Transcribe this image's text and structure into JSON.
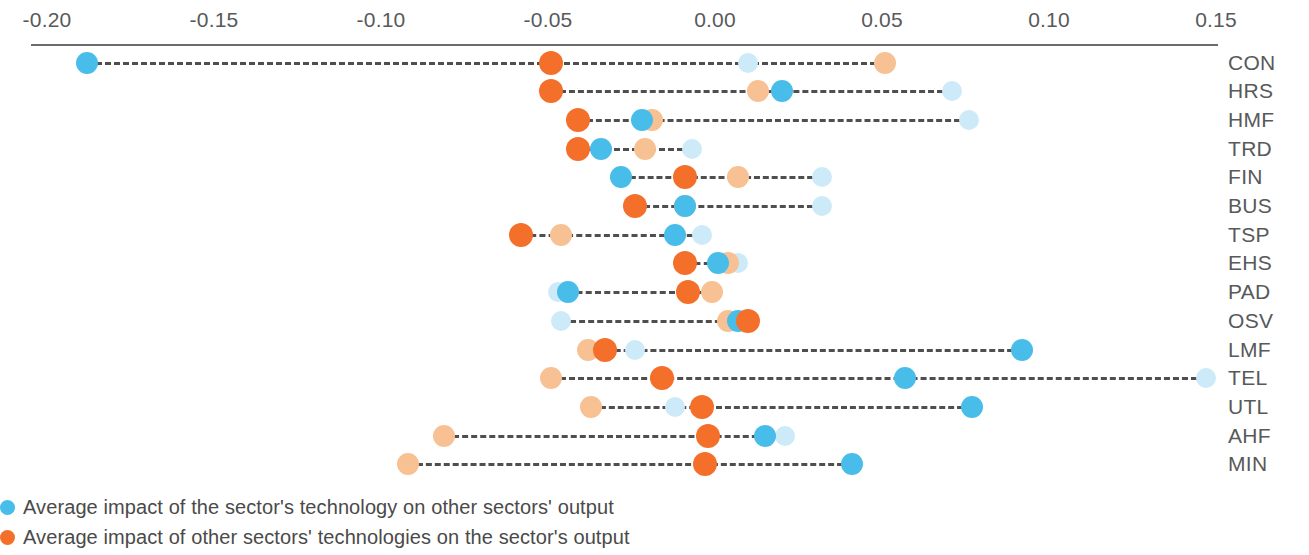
{
  "chart_data": {
    "type": "scatter",
    "title": "",
    "subtitle": "",
    "xlabel": "",
    "ylabel": "",
    "xlim": [
      -0.205,
      0.155
    ],
    "grid": false,
    "legend_position": "bottom",
    "axis": {
      "ticks": [
        -0.2,
        -0.15,
        -0.1,
        -0.05,
        0.0,
        0.05,
        0.1,
        0.15
      ],
      "tick_labels": [
        "-0.20",
        "-0.15",
        "-0.10",
        "-0.05",
        "0.00",
        "0.05",
        "0.10",
        "0.15"
      ]
    },
    "series": [
      {
        "name": "Average impact of the sector's technology on other sectors' output",
        "key": "blue",
        "color": "#49bdea"
      },
      {
        "name": "Average impact of other sectors' technologies on the sector's output",
        "key": "orange",
        "color": "#f4702a"
      },
      {
        "name": "light-blue-marker",
        "key": "lblue",
        "color": "#cdeaf8"
      },
      {
        "name": "light-orange-marker",
        "key": "lorange",
        "color": "#f8c193"
      }
    ],
    "categories": [
      "CON",
      "HRS",
      "HMF",
      "TRD",
      "FIN",
      "BUS",
      "TSP",
      "EHS",
      "PAD",
      "OSV",
      "LMF",
      "TEL",
      "UTL",
      "AHF",
      "MIN"
    ],
    "rows": [
      {
        "label": "CON",
        "blue": -0.188,
        "orange": -0.049,
        "lblue": 0.01,
        "lorange": 0.051
      },
      {
        "label": "HRS",
        "blue": 0.02,
        "orange": -0.049,
        "lblue": 0.071,
        "lorange": 0.013
      },
      {
        "label": "HMF",
        "blue": -0.022,
        "orange": -0.041,
        "lblue": 0.076,
        "lorange": -0.019
      },
      {
        "label": "TRD",
        "blue": -0.034,
        "orange": -0.041,
        "lblue": -0.007,
        "lorange": -0.021
      },
      {
        "label": "FIN",
        "blue": -0.028,
        "orange": -0.009,
        "lblue": 0.032,
        "lorange": 0.007
      },
      {
        "label": "BUS",
        "blue": -0.009,
        "orange": -0.024,
        "lblue": 0.032,
        "lorange": -0.009
      },
      {
        "label": "TSP",
        "blue": -0.012,
        "orange": -0.058,
        "lblue": -0.004,
        "lorange": -0.046
      },
      {
        "label": "EHS",
        "blue": 0.001,
        "orange": -0.009,
        "lblue": 0.007,
        "lorange": 0.004
      },
      {
        "label": "PAD",
        "blue": -0.044,
        "orange": -0.008,
        "lblue": -0.047,
        "lorange": -0.001
      },
      {
        "label": "OSV",
        "blue": 0.007,
        "orange": 0.01,
        "lblue": -0.046,
        "lorange": 0.004
      },
      {
        "label": "LMF",
        "blue": 0.092,
        "orange": -0.033,
        "lblue": -0.024,
        "lorange": -0.038
      },
      {
        "label": "TEL",
        "blue": 0.057,
        "orange": -0.016,
        "lblue": 0.147,
        "lorange": -0.049
      },
      {
        "label": "UTL",
        "blue": 0.077,
        "orange": -0.004,
        "lblue": -0.012,
        "lorange": -0.037
      },
      {
        "label": "AHF",
        "blue": 0.015,
        "orange": -0.002,
        "lblue": 0.021,
        "lorange": -0.081
      },
      {
        "label": "MIN",
        "blue": 0.041,
        "orange": -0.003,
        "lblue": null,
        "lorange": -0.092
      }
    ]
  },
  "legend": {
    "items": [
      {
        "label": "Average impact of the sector's technology on other sectors' output",
        "color": "#49bdea"
      },
      {
        "label": "Average impact of other sectors' technologies on the sector's output",
        "color": "#f4702a"
      }
    ]
  }
}
